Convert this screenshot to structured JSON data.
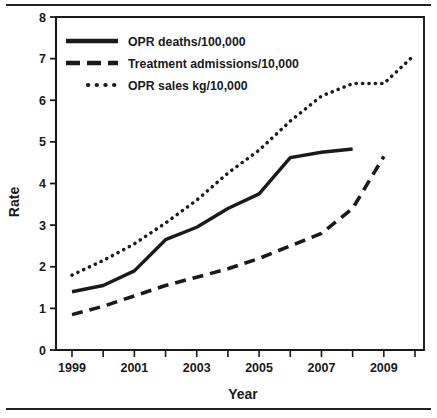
{
  "chart_data": {
    "type": "line",
    "title": "",
    "xlabel": "Year",
    "ylabel": "Rate",
    "xlim": [
      1998.5,
      2010.5
    ],
    "ylim": [
      0,
      8
    ],
    "grid": false,
    "legend_position": "top-left",
    "y_ticks": [
      "0",
      "1",
      "2",
      "3",
      "4",
      "5",
      "6",
      "7",
      "8"
    ],
    "y_tick_values": [
      0,
      1,
      2,
      3,
      4,
      5,
      6,
      7,
      8
    ],
    "x_ticks": [
      "1999",
      "",
      "2001",
      "",
      "2003",
      "",
      "2005",
      "",
      "2007",
      "",
      "2009",
      ""
    ],
    "x_tick_values": [
      1999,
      2000,
      2001,
      2002,
      2003,
      2004,
      2005,
      2006,
      2007,
      2008,
      2009,
      2010
    ],
    "x_labeled_ticks": [
      "1999",
      "2001",
      "2003",
      "2005",
      "2007",
      "2009"
    ],
    "series": [
      {
        "name": "OPR deaths/100,000",
        "style": "solid",
        "x": [
          1999,
          2000,
          2001,
          2002,
          2003,
          2004,
          2005,
          2006,
          2007,
          2008
        ],
        "values": [
          1.4,
          1.55,
          1.9,
          2.65,
          2.95,
          3.4,
          3.75,
          4.62,
          4.75,
          4.83
        ]
      },
      {
        "name": "Treatment admissions/10,000",
        "style": "dashed",
        "x": [
          1999,
          2000,
          2001,
          2002,
          2003,
          2004,
          2005,
          2006,
          2007,
          2008,
          2009
        ],
        "values": [
          0.85,
          1.05,
          1.3,
          1.55,
          1.75,
          1.95,
          2.2,
          2.5,
          2.8,
          3.4,
          4.65
        ]
      },
      {
        "name": "OPR sales kg/10,000",
        "style": "dotted",
        "x": [
          1999,
          2000,
          2001,
          2002,
          2003,
          2004,
          2005,
          2006,
          2007,
          2008,
          2009,
          2010
        ],
        "values": [
          1.8,
          2.15,
          2.55,
          3.05,
          3.6,
          4.25,
          4.8,
          5.5,
          6.1,
          6.4,
          6.4,
          7.1
        ]
      }
    ],
    "colors": {
      "ink": "#1a1a1a",
      "background": "#ffffff"
    }
  },
  "legend": {
    "items": [
      {
        "label": "OPR deaths/100,000"
      },
      {
        "label": "Treatment admissions/10,000"
      },
      {
        "label": "OPR sales kg/10,000"
      }
    ]
  },
  "axes": {
    "y_title": "Rate",
    "x_title": "Year"
  }
}
